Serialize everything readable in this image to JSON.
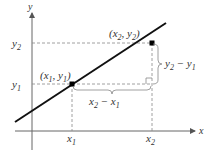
{
  "diagram": {
    "axes": {
      "x_label": "x",
      "y_label": "y"
    },
    "points": [
      {
        "name": "P1",
        "label_base": "(x",
        "sub1": "1",
        "mid": ", y",
        "sub2": "1",
        "end": ")"
      },
      {
        "name": "P2",
        "label_base": "(x",
        "sub1": "2",
        "mid": ", y",
        "sub2": "2",
        "end": ")"
      }
    ],
    "ticks": {
      "x1": {
        "base": "x",
        "sub": "1"
      },
      "x2": {
        "base": "x",
        "sub": "2"
      },
      "y1": {
        "base": "y",
        "sub": "1"
      },
      "y2": {
        "base": "y",
        "sub": "2"
      }
    },
    "braces": {
      "vertical": {
        "a": "y",
        "a_sub": "2",
        "minus": " − ",
        "b": "y",
        "b_sub": "1"
      },
      "horizontal": {
        "a": "x",
        "a_sub": "2",
        "minus": " − ",
        "b": "x",
        "b_sub": "1"
      }
    },
    "colors": {
      "line": "#111111",
      "axis": "#555555",
      "dashed": "#777777",
      "brace": "#888888"
    }
  }
}
